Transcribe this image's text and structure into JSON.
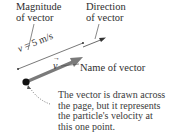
{
  "diagram": {
    "labels": {
      "magnitude": [
        "Magnitude",
        "of vector"
      ],
      "direction": [
        "Direction",
        "of vector"
      ],
      "name": "Name of vector"
    },
    "magnitude_value": {
      "variable": "v",
      "equals": " = 5 m/s"
    },
    "vector_symbol": {
      "letter": "v",
      "overarrow": "→"
    },
    "caption": [
      "The vector is drawn across",
      "the page, but it represents",
      "the particle's velocity at",
      "this one point."
    ],
    "colors": {
      "vector_arrow": "#7a7a7a",
      "point": "#111111",
      "leader_lines": "#555555",
      "text": "#2e2e2e"
    }
  }
}
